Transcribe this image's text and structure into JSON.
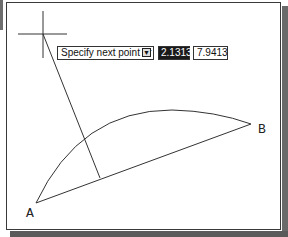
{
  "dynamic_input": {
    "prompt": "Specify next point or",
    "options_icon": "down-arrow-menu-icon",
    "options_glyph": "▼",
    "value_1": "2.1313",
    "value_2": "7.9413"
  },
  "drawing": {
    "label_a": "A",
    "label_b": "B",
    "line_color": "#333333"
  }
}
